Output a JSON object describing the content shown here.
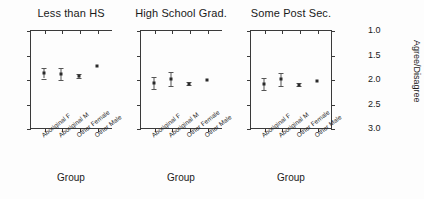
{
  "chart_data": {
    "type": "scatter",
    "title": "",
    "subtitle": "",
    "xlabel": "Group",
    "ylabel": "Agree/Disagree",
    "ylim": [
      1.0,
      3.0
    ],
    "yticks": [
      1.0,
      1.5,
      2.0,
      2.5,
      3.0
    ],
    "ytick_labels": [
      "1.0",
      "1.5",
      "2.0",
      "2.5",
      "3.0"
    ],
    "grid": false,
    "legend": "none",
    "categories": [
      "Aboriginal F",
      "Aboriginal M",
      "Other Female",
      "Other Male"
    ],
    "panels": [
      {
        "title": "Less than HS",
        "values": [
          2.12,
          2.1,
          2.07,
          2.26
        ],
        "errors": [
          0.11,
          0.13,
          0.04,
          0.02
        ]
      },
      {
        "title": "High School Grad.",
        "values": [
          1.92,
          2.0,
          1.9,
          1.97
        ],
        "errors": [
          0.12,
          0.14,
          0.03,
          0.02
        ]
      },
      {
        "title": "Some Post Sec.",
        "values": [
          1.9,
          1.99,
          1.88,
          1.95
        ],
        "errors": [
          0.13,
          0.14,
          0.03,
          0.02
        ]
      }
    ]
  },
  "axis": {
    "y_title": "Agree/Disagree",
    "x_title": "Group",
    "tick_labels": [
      "3.0",
      "2.5",
      "2.0",
      "1.5",
      "1.0"
    ]
  },
  "panel_titles": [
    "Less than HS",
    "High School Grad.",
    "Some Post Sec."
  ],
  "group_labels": [
    "Aboriginal F",
    "Aboriginal M",
    "Other Female",
    "Other Male"
  ],
  "colors": {
    "marker": "#2a2a2a",
    "error_bar": "#555555",
    "axis": "#3a3a3a",
    "text": "#1a1a1a",
    "background": "#fdfdfd"
  }
}
